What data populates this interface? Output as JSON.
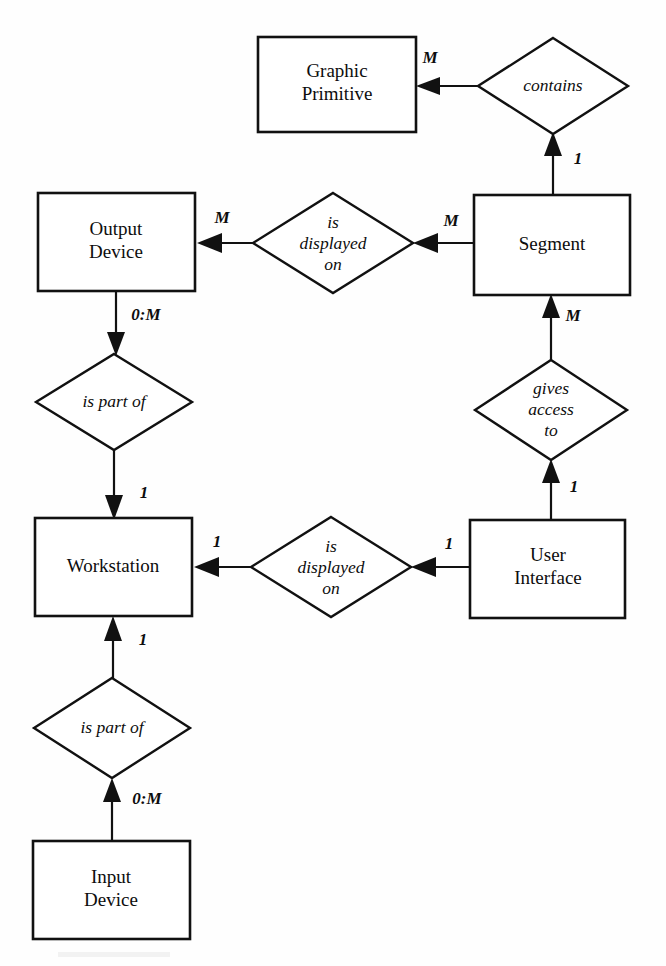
{
  "diagram": {
    "type": "entity-relationship-diagram",
    "notation": "Chen (boxes = entities, diamonds = relationships, arrows with cardinality labels)",
    "background_color": "#fefefe",
    "line_color": "#111111",
    "entities": [
      {
        "id": "graphic_primitive",
        "label_line1": "Graphic",
        "label_line2": "Primitive",
        "x": 258,
        "y": 37,
        "w": 158,
        "h": 95
      },
      {
        "id": "output_device",
        "label_line1": "Output",
        "label_line2": "Device",
        "x": 38,
        "y": 193,
        "w": 157,
        "h": 98
      },
      {
        "id": "segment",
        "label_line1": "Segment",
        "label_line2": "",
        "x": 474,
        "y": 195,
        "w": 156,
        "h": 100
      },
      {
        "id": "workstation",
        "label_line1": "Workstation",
        "label_line2": "",
        "x": 35,
        "y": 518,
        "w": 157,
        "h": 98
      },
      {
        "id": "user_interface",
        "label_line1": "User",
        "label_line2": "Interface",
        "x": 470,
        "y": 520,
        "w": 155,
        "h": 98
      },
      {
        "id": "input_device",
        "label_line1": "Input",
        "label_line2": "Device",
        "x": 33,
        "y": 841,
        "w": 157,
        "h": 98
      }
    ],
    "relationships": [
      {
        "id": "contains",
        "lines": [
          "contains"
        ],
        "cx": 553,
        "cy": 86,
        "rx": 75,
        "ry": 48
      },
      {
        "id": "is_displayed_on_segment",
        "lines": [
          "is",
          "displayed",
          "on"
        ],
        "cx": 333,
        "cy": 243,
        "rx": 80,
        "ry": 50
      },
      {
        "id": "is_part_of_output",
        "lines": [
          "is part of"
        ],
        "cx": 114,
        "cy": 402,
        "rx": 78,
        "ry": 48
      },
      {
        "id": "gives_access_to",
        "lines": [
          "gives",
          "access",
          "to"
        ],
        "cx": 551,
        "cy": 410,
        "rx": 76,
        "ry": 50
      },
      {
        "id": "is_displayed_on_ui",
        "lines": [
          "is",
          "displayed",
          "on"
        ],
        "cx": 331,
        "cy": 567,
        "rx": 80,
        "ry": 50
      },
      {
        "id": "is_part_of_input",
        "lines": [
          "is part of"
        ],
        "cx": 112,
        "cy": 728,
        "rx": 78,
        "ry": 50
      }
    ],
    "cardinalities": [
      {
        "id": "card-gp-contains",
        "value": "M",
        "x": 430,
        "y": 59
      },
      {
        "id": "card-segment-contains",
        "value": "1",
        "x": 578,
        "y": 160
      },
      {
        "id": "card-od-displayed",
        "value": "M",
        "x": 222,
        "y": 219
      },
      {
        "id": "card-segment-displayed",
        "value": "M",
        "x": 451,
        "y": 222
      },
      {
        "id": "card-od-ispartof",
        "value": "0:M",
        "x": 146,
        "y": 316
      },
      {
        "id": "card-segment-gives",
        "value": "M",
        "x": 573,
        "y": 317
      },
      {
        "id": "card-ws-ispartof-top",
        "value": "1",
        "x": 144,
        "y": 494
      },
      {
        "id": "card-gives-ui",
        "value": "1",
        "x": 574,
        "y": 488
      },
      {
        "id": "card-ws-displayed",
        "value": "1",
        "x": 217,
        "y": 543
      },
      {
        "id": "card-ui-displayed",
        "value": "1",
        "x": 449,
        "y": 545
      },
      {
        "id": "card-ws-ispartof-bot",
        "value": "1",
        "x": 143,
        "y": 641
      },
      {
        "id": "card-input-ispartof",
        "value": "0:M",
        "x": 147,
        "y": 800
      }
    ],
    "connections": [
      {
        "id": "contains-to-graphic-primitive",
        "from": "contains",
        "to": "graphic_primitive",
        "direction": "left"
      },
      {
        "id": "segment-to-contains",
        "from": "segment",
        "to": "contains",
        "direction": "up"
      },
      {
        "id": "displayed-to-output-device",
        "from": "is_displayed_on_segment",
        "to": "output_device",
        "direction": "left"
      },
      {
        "id": "segment-to-displayed",
        "from": "segment",
        "to": "is_displayed_on_segment",
        "direction": "left"
      },
      {
        "id": "output-device-to-is-part-of",
        "from": "output_device",
        "to": "is_part_of_output",
        "direction": "down"
      },
      {
        "id": "is-part-of-to-workstation",
        "from": "is_part_of_output",
        "to": "workstation",
        "direction": "down"
      },
      {
        "id": "segment-to-gives-access",
        "from": "gives_access_to",
        "to": "segment",
        "direction": "up"
      },
      {
        "id": "ui-to-gives-access",
        "from": "user_interface",
        "to": "gives_access_to",
        "direction": "up"
      },
      {
        "id": "displayed-ui-to-workstation",
        "from": "is_displayed_on_ui",
        "to": "workstation",
        "direction": "left"
      },
      {
        "id": "ui-to-displayed-ui",
        "from": "user_interface",
        "to": "is_displayed_on_ui",
        "direction": "left"
      },
      {
        "id": "is-part-of-input-to-workstation",
        "from": "is_part_of_input",
        "to": "workstation",
        "direction": "up"
      },
      {
        "id": "input-device-to-is-part-of",
        "from": "input_device",
        "to": "is_part_of_input",
        "direction": "up"
      }
    ]
  }
}
